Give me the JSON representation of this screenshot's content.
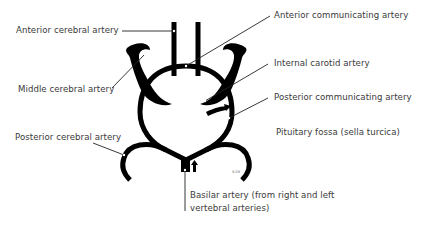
{
  "diagram": {
    "labels": {
      "anterior_cerebral": "Anterior cerebral artery",
      "anterior_communicating": "Anterior communicating artery",
      "middle_cerebral": "Middle cerebral artery",
      "internal_carotid": "Internal carotid artery",
      "posterior_communicating": "Posterior communicating artery",
      "pituitary_fossa": "Pituitary fossa (sella turcica)",
      "posterior_cerebral": "Posterior cerebral artery",
      "basilar_line1": "Basilar artery (from right and left",
      "basilar_line2": "vertebral arteries)"
    },
    "small_mark": "5/29",
    "colors": {
      "vessel": "#000000",
      "text": "#3a3a3a",
      "background": "#ffffff"
    }
  }
}
